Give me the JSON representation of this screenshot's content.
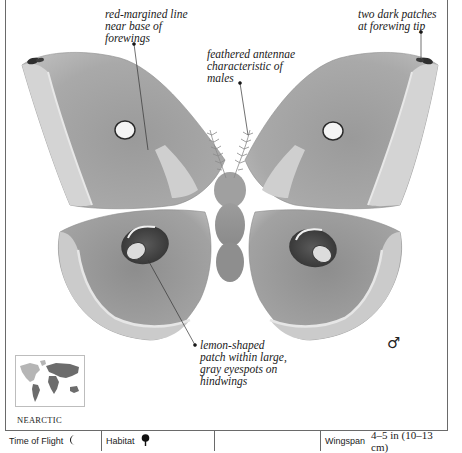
{
  "annotations": {
    "forewing_line": [
      "red-margined line",
      "near base of",
      "forewings"
    ],
    "forewing_tip": [
      "two dark patches",
      "at forewing tip"
    ],
    "antennae": [
      "feathered antennae",
      "characteristic of",
      "males"
    ],
    "eyespots": [
      "lemon-shaped",
      "patch within large,",
      "gray eyespots on",
      "hindwings"
    ]
  },
  "sex_symbol": "♂",
  "map": {
    "region_label": "NEARCTIC"
  },
  "footer": {
    "time_of_flight_label": "Time of Flight",
    "time_of_flight_icon": "crescent-moon-icon",
    "habitat_label": "Habitat",
    "habitat_icon": "tree-icon",
    "empty_cell": "",
    "wingspan_label": "Wingspan",
    "wingspan_value": "4–5 in (10–13 cm)"
  },
  "colors": {
    "wing_base": "#a8a8a8",
    "wing_light": "#d2d2d2",
    "wing_dark": "#7c7c7c",
    "border": "#6a6a6a"
  }
}
